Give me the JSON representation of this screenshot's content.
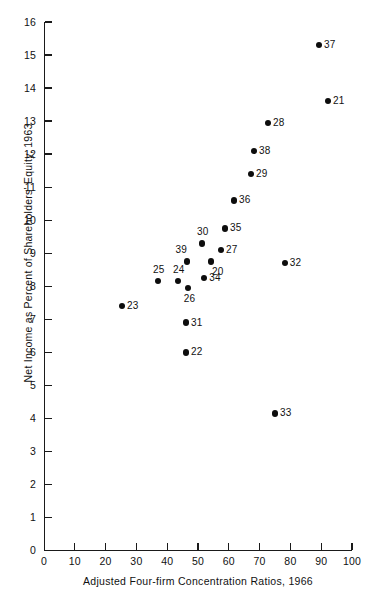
{
  "chart_data": {
    "type": "scatter",
    "title": "",
    "xlabel": "Adjusted Four-firm Concentration Ratios, 1966",
    "ylabel": "Net Income as Percent of Shareholders' Equity, 1963",
    "xlim": [
      0,
      100
    ],
    "ylim": [
      0,
      16
    ],
    "xticks": [
      0,
      10,
      20,
      30,
      40,
      50,
      60,
      70,
      80,
      90,
      100
    ],
    "yticks": [
      0,
      1,
      2,
      3,
      4,
      5,
      6,
      7,
      8,
      9,
      10,
      11,
      12,
      13,
      14,
      15,
      16
    ],
    "grid": false,
    "legend": null,
    "point_color": "#0d0d0d",
    "axis_color": "#1a1a1a",
    "points": [
      {
        "label": "37",
        "x": 89.3,
        "y": 15.3,
        "lab": "lab-r"
      },
      {
        "label": "21",
        "x": 92.2,
        "y": 13.6,
        "lab": "lab-r"
      },
      {
        "label": "28",
        "x": 72.7,
        "y": 12.95,
        "lab": "lab-r"
      },
      {
        "label": "38",
        "x": 68.2,
        "y": 12.1,
        "lab": "lab-r"
      },
      {
        "label": "29",
        "x": 67.2,
        "y": 11.4,
        "lab": "lab-r"
      },
      {
        "label": "36",
        "x": 61.7,
        "y": 10.6,
        "lab": "lab-r"
      },
      {
        "label": "35",
        "x": 58.8,
        "y": 9.75,
        "lab": "lab-r"
      },
      {
        "label": "30",
        "x": 51.3,
        "y": 9.3,
        "lab": "lab-t"
      },
      {
        "label": "27",
        "x": 57.5,
        "y": 9.1,
        "lab": "lab-r"
      },
      {
        "label": "20",
        "x": 54.2,
        "y": 8.75,
        "lab": "lab-br"
      },
      {
        "label": "39",
        "x": 46.4,
        "y": 8.75,
        "lab": "lab-tl"
      },
      {
        "label": "32",
        "x": 78.2,
        "y": 8.7,
        "lab": "lab-r"
      },
      {
        "label": "34",
        "x": 52.0,
        "y": 8.25,
        "lab": "lab-r"
      },
      {
        "label": "25",
        "x": 37.0,
        "y": 8.15,
        "lab": "lab-t"
      },
      {
        "label": "24",
        "x": 43.5,
        "y": 8.15,
        "lab": "lab-t"
      },
      {
        "label": "26",
        "x": 46.7,
        "y": 7.95,
        "lab": "lab-b"
      },
      {
        "label": "23",
        "x": 25.3,
        "y": 7.4,
        "lab": "lab-r"
      },
      {
        "label": "31",
        "x": 46.1,
        "y": 6.9,
        "lab": "lab-r"
      },
      {
        "label": "22",
        "x": 46.1,
        "y": 6.0,
        "lab": "lab-r"
      },
      {
        "label": "33",
        "x": 75.0,
        "y": 4.15,
        "lab": "lab-r"
      }
    ]
  }
}
